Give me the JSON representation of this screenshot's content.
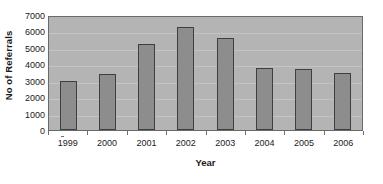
{
  "chart_data": {
    "type": "bar",
    "title": "",
    "xlabel": "Year",
    "ylabel": "No of Referrals",
    "categories": [
      "1999",
      "2000",
      "2001",
      "2002",
      "2003",
      "2004",
      "2005",
      "2006"
    ],
    "values": [
      3000,
      3400,
      5250,
      6250,
      5600,
      3750,
      3700,
      3450
    ],
    "series": [
      {
        "name": "No of Referrals",
        "values": [
          3000,
          3400,
          5250,
          6250,
          5600,
          3750,
          3700,
          3450
        ]
      }
    ],
    "ylim": [
      0,
      7000
    ],
    "ytick_values": [
      0,
      1000,
      2000,
      3000,
      4000,
      5000,
      6000,
      7000
    ],
    "ytick_labels": [
      "0",
      "1000",
      "2000",
      "3000",
      "4000",
      "5000",
      "6000",
      "7000"
    ],
    "grid": true,
    "grid_axis": "y",
    "legend": false,
    "legend_position": "none",
    "colors": {
      "plot_background": "#b4b4b4",
      "figure_background": "#ffffff",
      "bar_fill": "#8d8d8d",
      "bar_border": "#3f3f3f",
      "gridline": "#c4c4c4",
      "axis_line": "#6a6a6a",
      "text": "#1a1a1a"
    }
  }
}
